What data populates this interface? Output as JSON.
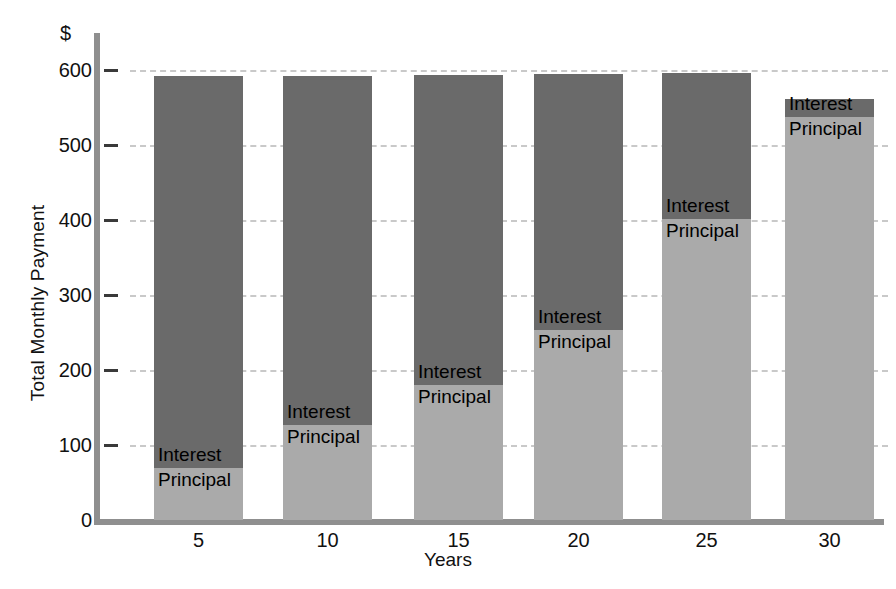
{
  "chart_data": {
    "type": "bar",
    "stacked": true,
    "title": "",
    "xlabel": "Years",
    "ylabel": "Total Monthly Payment",
    "currency_symbol": "$",
    "categories": [
      "5",
      "10",
      "15",
      "20",
      "25",
      "30"
    ],
    "ylim": [
      0,
      620
    ],
    "yticks": [
      0,
      100,
      200,
      300,
      400,
      500,
      600
    ],
    "ytick_labels": [
      "0",
      "100",
      "200",
      "300",
      "400",
      "500",
      "600"
    ],
    "grid": "horizontal-dashed",
    "legend": "in-bar-labels",
    "series": [
      {
        "name": "Principal",
        "label": "Principal",
        "color": "#aaaaaa",
        "values": [
          70,
          127,
          180,
          253,
          402,
          537
        ]
      },
      {
        "name": "Interest",
        "label": "Interest",
        "color": "#6a6a6a",
        "values": [
          522,
          465,
          413,
          342,
          194,
          24
        ]
      }
    ],
    "totals": [
      592,
      592,
      593,
      595,
      596,
      561
    ]
  },
  "axis": {
    "y_axis_color": "#8f8f8f",
    "x_axis_color": "#8f8f8f",
    "gridline_color": "#c9c9c9",
    "tick_color": "#3a3a3a"
  }
}
